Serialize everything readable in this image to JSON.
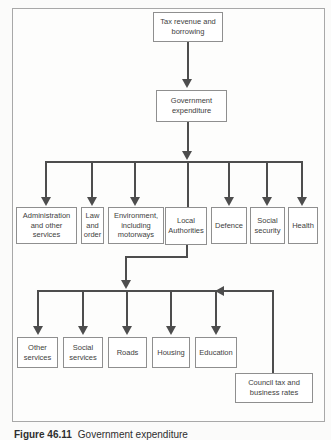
{
  "diagram": {
    "caption": {
      "number": "Figure 46.11",
      "title": "Government expenditure"
    },
    "colors": {
      "line": "#4d4d4d",
      "box_border": "#8f8f8f",
      "frame_border": "#a8a8a8",
      "text": "#3e3e3e",
      "background": "#fdfdfc"
    },
    "nodes": {
      "tax_revenue": {
        "label": "Tax revenue and borrowing"
      },
      "government_expenditure": {
        "label": "Government expenditure"
      },
      "administration": {
        "label": "Administration and other services"
      },
      "law_and_order": {
        "label": "Law and order"
      },
      "environment": {
        "label": "Environment, including motorways"
      },
      "local_authorities": {
        "label": "Local Authorities"
      },
      "defence": {
        "label": "Defence"
      },
      "social_security": {
        "label": "Social security"
      },
      "health": {
        "label": "Health"
      },
      "other_services": {
        "label": "Other services"
      },
      "social_services": {
        "label": "Social services"
      },
      "roads": {
        "label": "Roads"
      },
      "housing": {
        "label": "Housing"
      },
      "education": {
        "label": "Education"
      },
      "council_tax": {
        "label": "Council tax and business rates"
      }
    },
    "edges": [
      {
        "from": "tax_revenue",
        "to": "government_expenditure"
      },
      {
        "from": "government_expenditure",
        "to": "administration"
      },
      {
        "from": "government_expenditure",
        "to": "law_and_order"
      },
      {
        "from": "government_expenditure",
        "to": "environment"
      },
      {
        "from": "government_expenditure",
        "to": "local_authorities"
      },
      {
        "from": "government_expenditure",
        "to": "defence"
      },
      {
        "from": "government_expenditure",
        "to": "social_security"
      },
      {
        "from": "government_expenditure",
        "to": "health"
      },
      {
        "from": "local_authorities",
        "to": "other_services"
      },
      {
        "from": "local_authorities",
        "to": "social_services"
      },
      {
        "from": "local_authorities",
        "to": "roads"
      },
      {
        "from": "local_authorities",
        "to": "housing"
      },
      {
        "from": "local_authorities",
        "to": "education"
      },
      {
        "from": "council_tax",
        "to": "local_authorities_spending"
      }
    ]
  }
}
